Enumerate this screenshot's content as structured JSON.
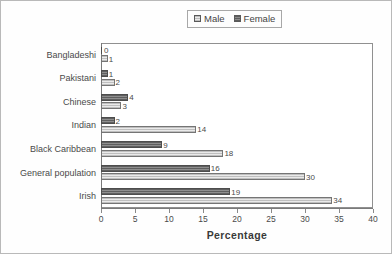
{
  "chart_data": {
    "type": "bar",
    "orientation": "horizontal",
    "title": "",
    "xlabel": "Percentage",
    "ylabel": "",
    "xlim": [
      0,
      40
    ],
    "xticks": [
      0,
      5,
      10,
      15,
      20,
      25,
      30,
      35,
      40
    ],
    "grid": false,
    "legend_position": "top-center",
    "categories": [
      "Bangladeshi",
      "Pakistani",
      "Chinese",
      "Indian",
      "Black Caribbean",
      "General population",
      "Irish"
    ],
    "series": [
      {
        "name": "Male",
        "color": "#d9d9d9",
        "values": [
          1,
          2,
          3,
          14,
          18,
          30,
          34
        ]
      },
      {
        "name": "Female",
        "color": "#6e6e6e",
        "values": [
          0,
          1,
          4,
          2,
          9,
          16,
          19
        ]
      }
    ]
  },
  "legend": {
    "items": [
      {
        "label": "Male",
        "swatch": "male"
      },
      {
        "label": "Female",
        "swatch": "female"
      }
    ]
  },
  "axis": {
    "x_title": "Percentage",
    "tick_labels": [
      "0",
      "5",
      "10",
      "15",
      "20",
      "25",
      "30",
      "35",
      "40"
    ]
  },
  "rows": [
    {
      "category": "Bangladeshi",
      "female": "0",
      "male": "1"
    },
    {
      "category": "Pakistani",
      "female": "1",
      "male": "2"
    },
    {
      "category": "Chinese",
      "female": "4",
      "male": "3"
    },
    {
      "category": "Indian",
      "female": "2",
      "male": "14"
    },
    {
      "category": "Black Caribbean",
      "female": "9",
      "male": "18"
    },
    {
      "category": "General population",
      "female": "16",
      "male": "30"
    },
    {
      "category": "Irish",
      "female": "19",
      "male": "34"
    }
  ]
}
